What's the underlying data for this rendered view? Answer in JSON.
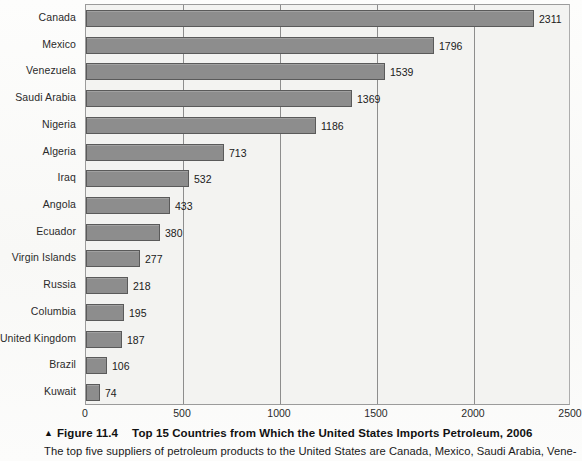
{
  "chart_data": {
    "type": "bar",
    "orientation": "horizontal",
    "title": "Top 15 Countries from Which the United States Imports Petroleum, 2006",
    "xlabel": "",
    "ylabel": "",
    "xlim": [
      0,
      2500
    ],
    "xticks": [
      "0",
      "500",
      "1000",
      "1500",
      "2000",
      "2500"
    ],
    "xtick_values": [
      0,
      500,
      1000,
      1500,
      2000,
      2500
    ],
    "grid": true,
    "legend": "none",
    "bar_color": "#8d8d8d",
    "bar_border_color": "#5a5a5a",
    "plot_background": "#f3f3f1",
    "categories": [
      "Canada",
      "Mexico",
      "Venezuela",
      "Saudi Arabia",
      "Nigeria",
      "Algeria",
      "Iraq",
      "Angola",
      "Ecuador",
      "Virgin Islands",
      "Russia",
      "Columbia",
      "United Kingdom",
      "Brazil",
      "Kuwait"
    ],
    "values": [
      2311,
      1796,
      1539,
      1369,
      1186,
      713,
      532,
      433,
      380,
      277,
      218,
      195,
      187,
      106,
      74
    ],
    "data_labels": [
      "2311",
      "1796",
      "1539",
      "1369",
      "1186",
      "713",
      "532",
      "433",
      "380",
      "277",
      "218",
      "195",
      "187",
      "106",
      "74"
    ]
  },
  "caption": {
    "marker_icon": "up-triangle-icon",
    "marker_glyph": "▲",
    "figure_number": "Figure 11.4",
    "figure_title": "Top 15 Countries from Which the United States Imports Petroleum, 2006",
    "body_text": "The top five suppliers of petroleum products to the United States are Canada, Mexico, Saudi Arabia, Vene-"
  }
}
